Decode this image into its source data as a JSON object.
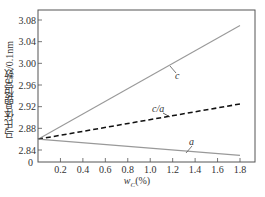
{
  "chart_data": {
    "type": "line",
    "title": "",
    "xlabel": "w_C(%)",
    "ylabel": "马氏体晶格常数/0.1nm",
    "x_ticks": [
      "0",
      "0.2",
      "0.4",
      "0.6",
      "0.8",
      "1.0",
      "1.2",
      "1.4",
      "1.6",
      "1.8"
    ],
    "y_ticks": [
      "2.84",
      "2.88",
      "2.92",
      "2.96",
      "3.00",
      "3.04",
      "3.08"
    ],
    "xlim": [
      0,
      2.0
    ],
    "ylim": [
      2.82,
      3.1
    ],
    "grid": false,
    "legend": "inline labels",
    "series": [
      {
        "name": "c",
        "style": "solid gray",
        "x": [
          0,
          1.8
        ],
        "values": [
          2.86,
          3.07
        ]
      },
      {
        "name": "c/a",
        "style": "dashed black",
        "x": [
          0,
          1.8
        ],
        "values": [
          2.86,
          2.925
        ]
      },
      {
        "name": "a",
        "style": "solid gray",
        "x": [
          0,
          1.8
        ],
        "values": [
          2.86,
          2.83
        ]
      }
    ]
  },
  "labels": {
    "c": "c",
    "ca": "c/a",
    "a": "a",
    "xlabel_main": "w",
    "xlabel_sub": "C",
    "xlabel_unit": "(%)",
    "origin": "0"
  }
}
